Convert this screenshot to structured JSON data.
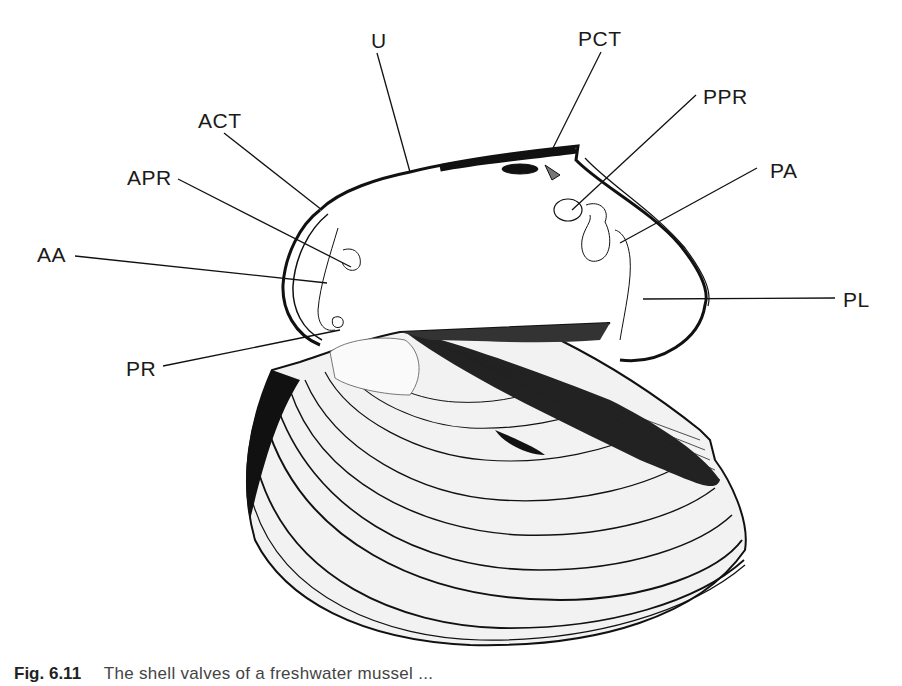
{
  "figure": {
    "labels": [
      {
        "id": "U",
        "text": "U",
        "x": 371,
        "y": 30
      },
      {
        "id": "PCT",
        "text": "PCT",
        "x": 578,
        "y": 28
      },
      {
        "id": "PPR",
        "text": "PPR",
        "x": 703,
        "y": 86
      },
      {
        "id": "ACT",
        "text": "ACT",
        "x": 198,
        "y": 110
      },
      {
        "id": "PA",
        "text": "PA",
        "x": 770,
        "y": 160
      },
      {
        "id": "APR",
        "text": "APR",
        "x": 127,
        "y": 167
      },
      {
        "id": "AA",
        "text": "AA",
        "x": 37,
        "y": 244
      },
      {
        "id": "PL",
        "text": "PL",
        "x": 843,
        "y": 289
      },
      {
        "id": "PR",
        "text": "PR",
        "x": 126,
        "y": 358
      }
    ]
  },
  "caption": {
    "figure_number": "Fig. 6.11",
    "text": "The shell valves of a freshwater mussel ..."
  }
}
